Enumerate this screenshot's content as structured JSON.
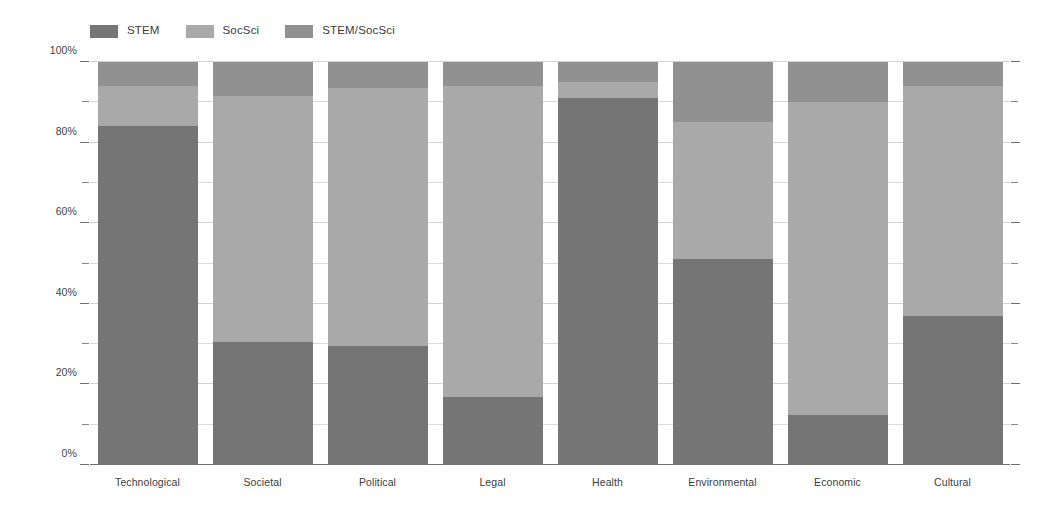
{
  "chart_data": {
    "type": "bar",
    "stacked": true,
    "orientation": "vertical",
    "title": "",
    "subtitle": "",
    "xlabel": "",
    "ylabel": "",
    "ylim": [
      0,
      100
    ],
    "y_unit": "%",
    "grid": true,
    "legend_position": "top-left",
    "categories": [
      "Technological",
      "Societal",
      "Political",
      "Legal",
      "Health",
      "Environmental",
      "Economic",
      "Cultural"
    ],
    "series": [
      {
        "name": "STEM",
        "color": "#757575",
        "values": [
          84,
          30.5,
          29.5,
          17,
          91,
          51,
          12.5,
          37
        ]
      },
      {
        "name": "SocSci",
        "color": "#a9a9a9",
        "values": [
          10,
          61,
          64,
          77,
          4,
          34,
          77.5,
          57
        ]
      },
      {
        "name": "STEM/SocSci",
        "color": "#919191",
        "values": [
          6,
          8.5,
          6.5,
          6,
          5,
          15,
          10,
          6
        ]
      }
    ],
    "y_ticks_major": [
      {
        "value": 0,
        "label": "0%"
      },
      {
        "value": 20,
        "label": "20%"
      },
      {
        "value": 40,
        "label": "40%"
      },
      {
        "value": 60,
        "label": "60%"
      },
      {
        "value": 80,
        "label": "80%"
      },
      {
        "value": 100,
        "label": "100%"
      }
    ],
    "y_ticks_minor": [
      10,
      30,
      50,
      70,
      90
    ],
    "colors": {
      "stem": "#757575",
      "socsci": "#a9a9a9",
      "stem_socsci": "#919191",
      "gridline": "#d9d9d9",
      "axis": "#6e6e6e",
      "text": "#3c3c3c",
      "background": "#ffffff"
    }
  },
  "legend": {
    "items": [
      {
        "label": "STEM",
        "color": "#757575"
      },
      {
        "label": "SocSci",
        "color": "#a9a9a9"
      },
      {
        "label": "STEM/SocSci",
        "color": "#919191"
      }
    ]
  }
}
